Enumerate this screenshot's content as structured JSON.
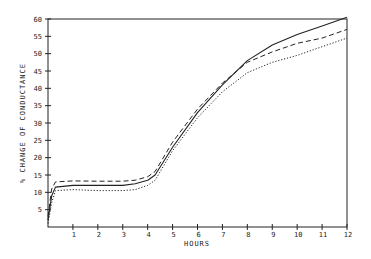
{
  "chart_data": {
    "type": "line",
    "title": "",
    "xlabel": "HOURS",
    "ylabel": "% CHANGE OF CONDUCTANCE",
    "xlim": [
      0,
      12
    ],
    "ylim": [
      0,
      60
    ],
    "x_ticks": [
      "1",
      "2",
      "3",
      "4",
      "5",
      "6",
      "7",
      "8",
      "9",
      "10",
      "11",
      "12"
    ],
    "y_ticks": [
      "5",
      "10",
      "15",
      "20",
      "25",
      "30",
      "35",
      "40",
      "45",
      "50",
      "55",
      "60"
    ],
    "grid": false,
    "legend": null,
    "x": [
      0,
      0.15,
      0.3,
      1,
      2,
      3,
      3.5,
      4,
      4.3,
      5,
      6,
      7,
      8,
      9,
      10,
      11,
      12
    ],
    "series": [
      {
        "name": "solid",
        "style": "solid",
        "values": [
          2,
          9,
          11.5,
          12,
          12,
          12,
          12.5,
          13.5,
          15,
          23,
          33,
          41,
          48,
          52.5,
          55.5,
          58,
          60.5
        ]
      },
      {
        "name": "dashed",
        "style": "dashed",
        "values": [
          3,
          11,
          13,
          13.3,
          13.2,
          13.2,
          13.5,
          14.5,
          16,
          24.5,
          34,
          41.5,
          47.5,
          50.5,
          53,
          54.5,
          57
        ]
      },
      {
        "name": "dotted",
        "style": "dotted",
        "values": [
          1,
          7,
          10.5,
          10.8,
          10.5,
          10.5,
          10.8,
          12,
          13.5,
          22,
          31.5,
          39,
          44.5,
          47.5,
          49.5,
          52,
          54.5
        ]
      }
    ]
  }
}
